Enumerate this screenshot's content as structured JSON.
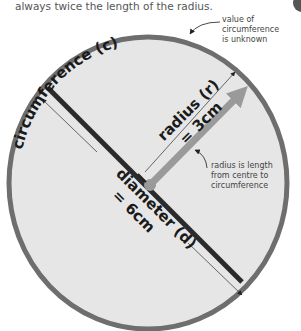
{
  "intro_text": "always twice the length of the radius.",
  "labels": {
    "circumference": "circumference (c)",
    "radius_line1": "radius (r)",
    "radius_line2": "= 3cm",
    "diameter_line1": "diameter (d)",
    "diameter_line2": "= 6cm"
  },
  "annotations": {
    "circumference_note": [
      "value of",
      "circumference",
      "is unknown"
    ],
    "radius_note": [
      "radius is length",
      "from centre to",
      "circumference"
    ]
  },
  "values": {
    "radius_cm": 3,
    "diameter_cm": 6,
    "circumference": "unknown"
  },
  "colors": {
    "circle_fill": "#e6e6e6",
    "circle_stroke": "#6e6e6e",
    "diameter_line": "#2b2b2b",
    "radius_arrow": "#9a9a9a",
    "annotation_text": "#444444"
  }
}
